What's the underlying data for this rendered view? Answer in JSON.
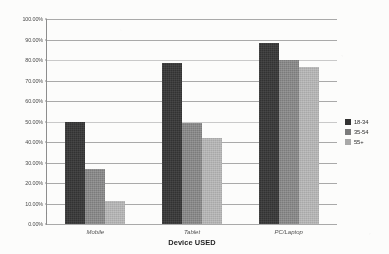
{
  "chart_data": {
    "type": "bar",
    "title": "",
    "subtitle": "",
    "xlabel": "Device USED",
    "ylabel": "",
    "categories": [
      "Mobile",
      "Tablet",
      "PC/Laptop"
    ],
    "series": [
      {
        "name": "18-34",
        "color": "#2f2f2f",
        "values": [
          50.0,
          78.5,
          88.5
        ]
      },
      {
        "name": "35-54",
        "color": "#7a7a7a",
        "values": [
          27.0,
          49.5,
          80.0
        ]
      },
      {
        "name": "55+",
        "color": "#a8a8a8",
        "values": [
          11.0,
          42.0,
          76.5
        ]
      }
    ],
    "ylim": [
      0,
      100
    ],
    "ytick_values": [
      0,
      10,
      20,
      30,
      40,
      50,
      60,
      70,
      80,
      90,
      100
    ],
    "ytick_labels": [
      "0.00%",
      "10.00%",
      "20.00%",
      "30.00%",
      "40.00%",
      "50.00%",
      "60.00%",
      "70.00%",
      "80.00%",
      "90.00%",
      "100.00%"
    ],
    "grid": "horizontal",
    "legend_position": "right",
    "grouping": "clustered"
  },
  "axes": {
    "x_title": "Device USED",
    "tick_labels": [
      "Mobile",
      "Tablet",
      "PC/Laptop"
    ]
  },
  "legend": {
    "entries": [
      {
        "label": "18-34"
      },
      {
        "label": "35-54"
      },
      {
        "label": "55+"
      }
    ]
  },
  "colors": {
    "series_18_34": "#2f2f2f",
    "series_35_54": "#7a7a7a",
    "series_55_plus": "#a8a8a8",
    "gridline": "#a9a9a9",
    "axis": "#8c8c8c",
    "background": "#fdfdfc"
  }
}
